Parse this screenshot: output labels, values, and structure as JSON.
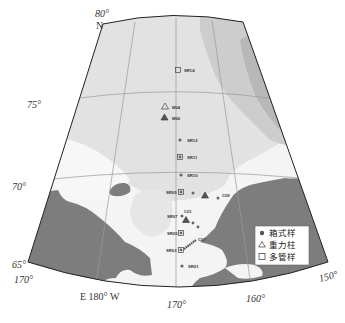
{
  "map": {
    "projection": "conic fan",
    "colors": {
      "land": "#7d7d7d",
      "shelf_shallow": "#f4f4f4",
      "mid_depth": "#dedede",
      "deep": "#c8c8c8",
      "deepest": "#b4b4b4",
      "graticule": "#9a9a9a",
      "border": "#222222",
      "marker": "#6a6a6a"
    },
    "latitude_labels": {
      "lat80": "80°",
      "north": "N",
      "lat75": "75°",
      "lat70": "70°",
      "lat65": "65°"
    },
    "longitude_labels": {
      "lon170E": "170°",
      "lon180": "E  180° W",
      "lon170W": "170°",
      "lon160W": "160°",
      "lon150W": "150°"
    },
    "stations": [
      {
        "id": "SR14",
        "type": "multicore",
        "label": "SR14"
      },
      {
        "id": "M04",
        "type": "gravity",
        "label": "M04"
      },
      {
        "id": "M06",
        "type": "gravity",
        "label": "M06"
      },
      {
        "id": "SR12",
        "type": "box",
        "label": "SR12"
      },
      {
        "id": "SR11",
        "type": "box+multicore",
        "label": "SR11"
      },
      {
        "id": "SR10",
        "type": "box",
        "label": "SR10"
      },
      {
        "id": "SR09",
        "type": "box+multicore",
        "label": "SR09"
      },
      {
        "id": "C09",
        "type": "box",
        "label": "C09"
      },
      {
        "id": "C01",
        "type": "label",
        "label": "C01"
      },
      {
        "id": "SR07",
        "type": "box",
        "label": "SR07"
      },
      {
        "id": "SR05",
        "type": "box+multicore",
        "label": "SR05"
      },
      {
        "id": "C07",
        "type": "transect",
        "label": "C07"
      },
      {
        "id": "SR03",
        "type": "box+multicore",
        "label": "SR03"
      },
      {
        "id": "SR01",
        "type": "box",
        "label": "SR01"
      }
    ],
    "legend": {
      "items": [
        {
          "symbol": "filled-circle",
          "label": "箱式样"
        },
        {
          "symbol": "open-triangle",
          "label": "重力柱"
        },
        {
          "symbol": "open-square",
          "label": "多管样"
        }
      ]
    }
  }
}
